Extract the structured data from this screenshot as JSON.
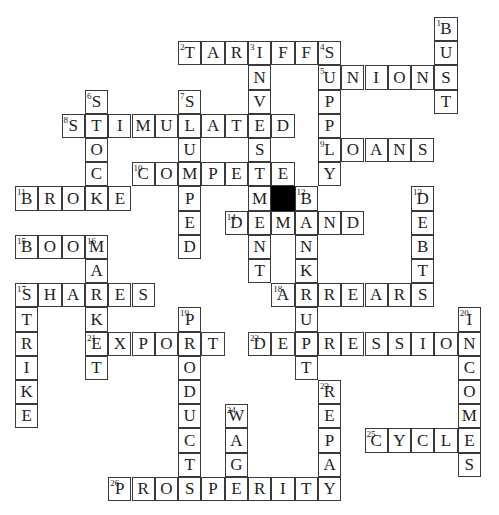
{
  "puzzle": {
    "grid": {
      "origin_x": 15,
      "origin_y": 17,
      "cell_width": 23.3,
      "cell_height": 24.2,
      "border_color": "#3a3a3a",
      "block_color": "#000000"
    },
    "blocks": [
      [
        11,
        7
      ]
    ],
    "entries": [
      {
        "number": "1",
        "direction": "down",
        "word": "BUST",
        "col": 18,
        "row": 0
      },
      {
        "number": "2",
        "direction": "across",
        "word": "TARIFFS",
        "col": 7,
        "row": 1
      },
      {
        "number": "3",
        "direction": "down",
        "word": "INVESTMENT",
        "col": 10,
        "row": 1
      },
      {
        "number": "4",
        "direction": "down",
        "word": "SUPPLY",
        "col": 13,
        "row": 1
      },
      {
        "number": "5",
        "direction": "across",
        "word": "UNIONS",
        "col": 13,
        "row": 2
      },
      {
        "number": "6",
        "direction": "down",
        "word": "STOCK",
        "col": 3,
        "row": 3
      },
      {
        "number": "7",
        "direction": "down",
        "word": "SLUMPED",
        "col": 7,
        "row": 3
      },
      {
        "number": "8",
        "direction": "across",
        "word": "STIMULATED",
        "col": 2,
        "row": 4
      },
      {
        "number": "9",
        "direction": "across",
        "word": "LOANS",
        "col": 13,
        "row": 5
      },
      {
        "number": "10",
        "direction": "across",
        "word": "COMPETE",
        "col": 5,
        "row": 6
      },
      {
        "number": "11",
        "direction": "across",
        "word": "BROKE",
        "col": 0,
        "row": 7
      },
      {
        "number": "12",
        "direction": "down",
        "word": "BANKRUPT",
        "col": 12,
        "row": 7
      },
      {
        "number": "13",
        "direction": "down",
        "word": "DEBTS",
        "col": 17,
        "row": 7
      },
      {
        "number": "14",
        "direction": "across",
        "word": "DEMAND",
        "col": 9,
        "row": 8
      },
      {
        "number": "15",
        "direction": "across",
        "word": "BOOM",
        "col": 0,
        "row": 9
      },
      {
        "number": "16",
        "direction": "down",
        "word": "MARKET",
        "col": 3,
        "row": 9
      },
      {
        "number": "17",
        "direction": "across",
        "word": "SHARES",
        "col": 0,
        "row": 11
      },
      {
        "number": "17",
        "direction": "down",
        "word": "STRIKE",
        "col": 0,
        "row": 11
      },
      {
        "number": "18",
        "direction": "across",
        "word": "ARREARS",
        "col": 11,
        "row": 11
      },
      {
        "number": "19",
        "direction": "down",
        "word": "PRODUCTS",
        "col": 7,
        "row": 12
      },
      {
        "number": "20",
        "direction": "down",
        "word": "INCOMES",
        "col": 19,
        "row": 12
      },
      {
        "number": "21",
        "direction": "across",
        "word": "EXPORT",
        "col": 3,
        "row": 13
      },
      {
        "number": "22",
        "direction": "across",
        "word": "DEPRESSION",
        "col": 10,
        "row": 13
      },
      {
        "number": "23",
        "direction": "down",
        "word": "REPAY",
        "col": 13,
        "row": 15
      },
      {
        "number": "24",
        "direction": "down",
        "word": "WAGE",
        "col": 9,
        "row": 16
      },
      {
        "number": "25",
        "direction": "across",
        "word": "CYCLE",
        "col": 15,
        "row": 17
      },
      {
        "number": "26",
        "direction": "across",
        "word": "PROSPERITY",
        "col": 4,
        "row": 19
      }
    ]
  }
}
